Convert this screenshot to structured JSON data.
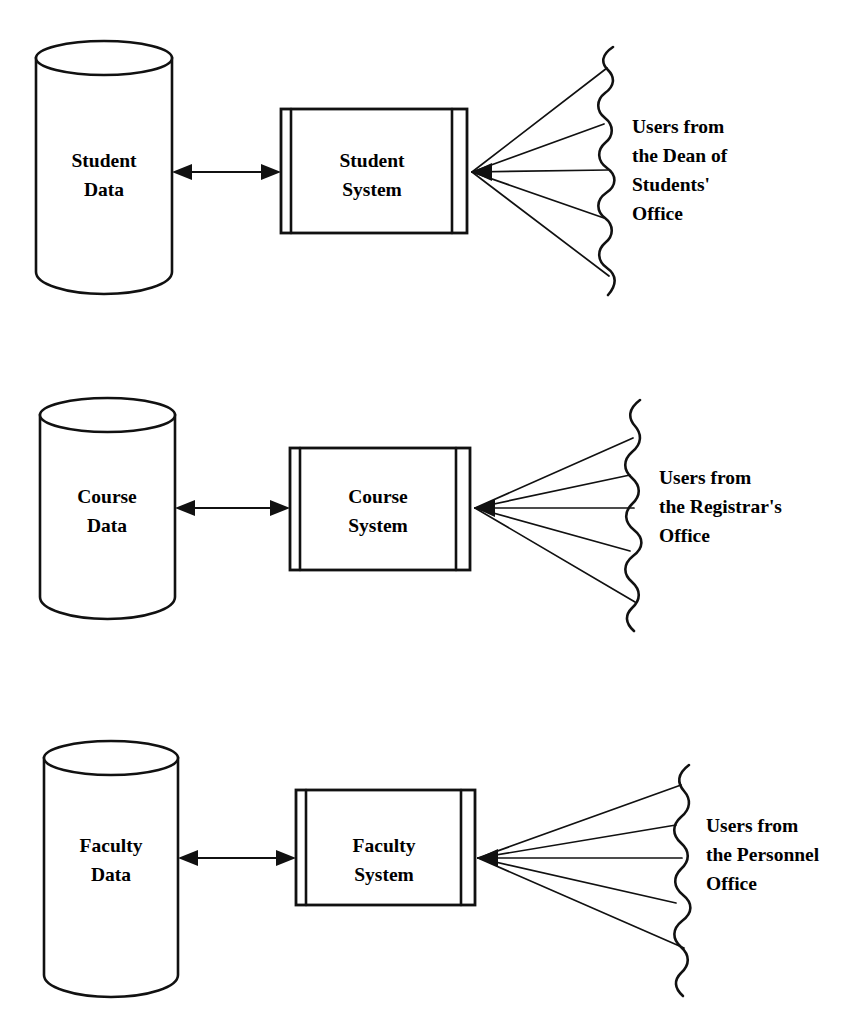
{
  "diagram": {
    "type": "system-context-diagram",
    "background_color": "#ffffff",
    "stroke_color": "#111111",
    "text_color": "#000000",
    "rows": [
      {
        "id": "student",
        "datastore_label_line1": "Student",
        "datastore_label_line2": "Data",
        "system_label_line1": "Student",
        "system_label_line2": "System",
        "users_lines": [
          "Users from",
          "the Dean of",
          "Students'",
          "Office"
        ],
        "users_bold": false,
        "connector": "bidirectional-arrow",
        "fan_line_count": 5
      },
      {
        "id": "course",
        "datastore_label_line1": "Course",
        "datastore_label_line2": "Data",
        "system_label_line1": "Course",
        "system_label_line2": "System",
        "users_lines": [
          "Users from",
          "the Registrar's",
          "Office"
        ],
        "users_bold": true,
        "connector": "bidirectional-arrow",
        "fan_line_count": 5
      },
      {
        "id": "faculty",
        "datastore_label_line1": "Faculty",
        "datastore_label_line2": "Data",
        "system_label_line1": "Faculty",
        "system_label_line2": "System",
        "users_lines": [
          "Users from",
          "the Personnel",
          "Office"
        ],
        "users_bold": false,
        "connector": "bidirectional-arrow",
        "fan_line_count": 5
      }
    ]
  }
}
